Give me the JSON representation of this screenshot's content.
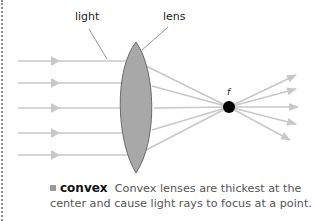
{
  "labels": {
    "light": "light",
    "lens": "lens",
    "focal_point": "f"
  },
  "caption": {
    "term": "convex",
    "line1": "Convex lenses are thickest at the",
    "line2": "center and cause light rays to focus at a point."
  },
  "colors": {
    "ray": "#c8c8c8",
    "lens_fill": "#a8a8a8",
    "lens_stroke": "#6a6a6a",
    "focal_dot": "#000000",
    "leader_line": "#777777"
  },
  "diagram": {
    "ray_count": 5,
    "ray_y": [
      61,
      83,
      108,
      133,
      155
    ],
    "focal_point": {
      "x": 229,
      "y": 107
    }
  }
}
